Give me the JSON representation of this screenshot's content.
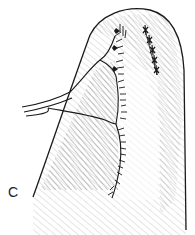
{
  "figure": {
    "panel_label": "C",
    "colors": {
      "ink": "#1a1a1a",
      "hatch": "#555555",
      "background": "#ffffff"
    }
  }
}
